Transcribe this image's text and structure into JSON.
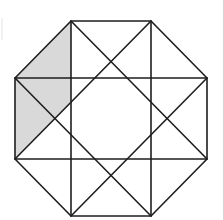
{
  "diagram": {
    "type": "octagon-grid-figure",
    "width": 223,
    "height": 220,
    "colors": {
      "background": "#ffffff",
      "stroke": "#1e1e1e",
      "shade": "#d9d9d9",
      "artifact": "#e4e4e4"
    },
    "stroke_width": 1.6,
    "octagon": {
      "points": [
        [
          71,
          21
        ],
        [
          151,
          21
        ],
        [
          207,
          78
        ],
        [
          207,
          159
        ],
        [
          151,
          216
        ],
        [
          71,
          216
        ],
        [
          15,
          159
        ],
        [
          15,
          78
        ]
      ]
    },
    "shaded_region": {
      "points": [
        [
          71,
          21
        ],
        [
          71,
          102
        ],
        [
          15,
          159
        ],
        [
          15,
          78
        ]
      ]
    },
    "lines": [
      {
        "name": "vertical-left",
        "x1": 71,
        "y1": 21,
        "x2": 71,
        "y2": 216
      },
      {
        "name": "vertical-right",
        "x1": 151,
        "y1": 21,
        "x2": 151,
        "y2": 216
      },
      {
        "name": "horizontal-top",
        "x1": 15,
        "y1": 78,
        "x2": 207,
        "y2": 78
      },
      {
        "name": "horizontal-bottom",
        "x1": 15,
        "y1": 159,
        "x2": 207,
        "y2": 159
      },
      {
        "name": "diagonal-a",
        "x1": 71,
        "y1": 21,
        "x2": 207,
        "y2": 159
      },
      {
        "name": "diagonal-b",
        "x1": 151,
        "y1": 21,
        "x2": 15,
        "y2": 159
      },
      {
        "name": "diagonal-c",
        "x1": 15,
        "y1": 78,
        "x2": 151,
        "y2": 216
      },
      {
        "name": "diagonal-d",
        "x1": 207,
        "y1": 78,
        "x2": 71,
        "y2": 216
      }
    ],
    "edge_artifact": {
      "x1": 2,
      "y1": 18,
      "x2": 2,
      "y2": 40
    }
  }
}
